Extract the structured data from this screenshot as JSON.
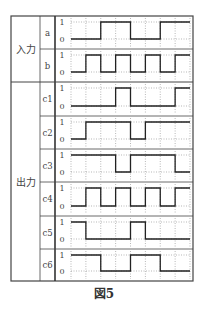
{
  "figure": {
    "caption": "図5",
    "groups": [
      {
        "label": "入力",
        "rows": [
          "a",
          "b"
        ]
      },
      {
        "label": "出力",
        "rows": [
          "c1",
          "c2",
          "c3",
          "c4",
          "c5",
          "c6"
        ]
      }
    ],
    "level_labels": {
      "high": "1",
      "low": "0"
    },
    "time_slots": 8,
    "signals": [
      {
        "name": "a",
        "values": [
          0,
          0,
          1,
          1,
          0,
          0,
          1,
          1
        ]
      },
      {
        "name": "b",
        "values": [
          0,
          1,
          0,
          1,
          0,
          1,
          0,
          1
        ]
      },
      {
        "name": "c1",
        "values": [
          0,
          0,
          0,
          1,
          0,
          0,
          0,
          1
        ]
      },
      {
        "name": "c2",
        "values": [
          0,
          1,
          1,
          1,
          0,
          1,
          1,
          1
        ]
      },
      {
        "name": "c3",
        "values": [
          1,
          1,
          1,
          0,
          1,
          1,
          1,
          0
        ]
      },
      {
        "name": "c4",
        "values": [
          0,
          1,
          0,
          1,
          0,
          1,
          0,
          1
        ]
      },
      {
        "name": "c5",
        "values": [
          1,
          0,
          0,
          0,
          1,
          0,
          0,
          0
        ]
      },
      {
        "name": "c6",
        "values": [
          1,
          1,
          0,
          0,
          1,
          1,
          0,
          0
        ]
      }
    ]
  }
}
